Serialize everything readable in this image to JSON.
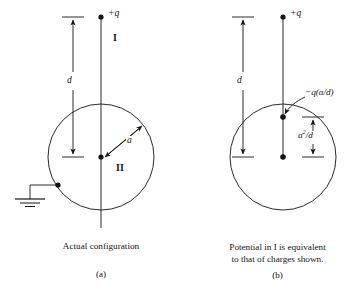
{
  "figure": {
    "type": "physics-diagram",
    "background_color": "#ffffff",
    "ink_color": "#141414"
  },
  "panel_a": {
    "letter": "(a)",
    "caption": "Actual configuration",
    "charge_label": "+q",
    "distance_label": "d",
    "radius_label": "a",
    "region_outside_label": "I",
    "region_inside_label": "II",
    "ground_symbol": "earth-ground",
    "elements": {
      "sphere": "circle",
      "charge": "filled-dot",
      "center": "filled-dot",
      "ground_contact": "filled-dot"
    }
  },
  "panel_b": {
    "letter": "(b)",
    "caption": "Potential in I is equivalent\nto that of charges shown.",
    "charge_label": "+q",
    "distance_label": "d",
    "image_charge_label": "−q(a/d)",
    "image_distance_label_base": "a",
    "image_distance_label_exp": "2",
    "image_distance_label_tail": "/d",
    "image_distance_label_full": "a²/d",
    "elements": {
      "sphere": "circle",
      "charge": "filled-dot",
      "image_charge": "filled-dot",
      "center": "filled-dot",
      "leader_line": "pointer-to-image-charge"
    }
  }
}
